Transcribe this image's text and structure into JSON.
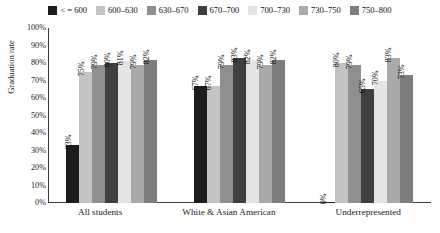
{
  "chart_data": {
    "type": "bar",
    "title": "",
    "xlabel": "",
    "ylabel": "Graduation rate",
    "ylim": [
      0,
      100
    ],
    "ytick_labels": [
      "100%",
      "90%",
      "80%",
      "70%",
      "60%",
      "50%",
      "40%",
      "30%",
      "20%",
      "10%",
      "0%"
    ],
    "ytick_values": [
      100,
      90,
      80,
      70,
      60,
      50,
      40,
      30,
      20,
      10,
      0
    ],
    "grid": false,
    "legend_position": "top",
    "categories": [
      "All students",
      "White & Asian American",
      "Underrepresented"
    ],
    "series": [
      {
        "name": "< = 600",
        "color": "#1c1c1c",
        "values": [
          33,
          67,
          0
        ]
      },
      {
        "name": "600–630",
        "color": "#c3c3c3",
        "values": [
          75,
          67,
          80
        ]
      },
      {
        "name": "630–670",
        "color": "#8f8f8f",
        "values": [
          79,
          79,
          79
        ]
      },
      {
        "name": "670–700",
        "color": "#3f3f3f",
        "values": [
          80,
          83,
          65
        ]
      },
      {
        "name": "700–730",
        "color": "#e4e4e4",
        "values": [
          81,
          82,
          70
        ]
      },
      {
        "name": "730–750",
        "color": "#aaaaaa",
        "values": [
          79,
          79,
          83
        ]
      },
      {
        "name": "750–800",
        "color": "#7d7d7d",
        "values": [
          82,
          82,
          73
        ]
      }
    ],
    "value_labels": [
      [
        "33%",
        "75%",
        "79%",
        "80%",
        "81%",
        "79%",
        "82%"
      ],
      [
        "67%",
        "67%",
        "79%",
        "83%",
        "82%",
        "79%",
        "82%"
      ],
      [
        "0%",
        "80%",
        "79%",
        "65%",
        "70%",
        "83%",
        "73%"
      ]
    ]
  }
}
